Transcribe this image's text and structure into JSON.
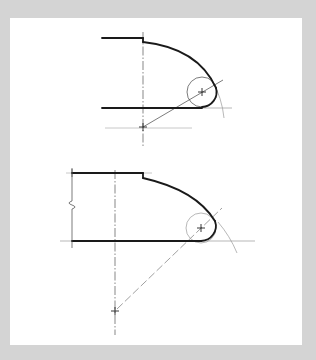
{
  "figure": {
    "title": "",
    "colors": {
      "background": "#d4d4d4",
      "panel": "#ffffff",
      "object_line": "#1a1a1a",
      "construction_line": "#9a9a9a"
    },
    "views": [
      {
        "id": "top",
        "elements": [
          "object-outline",
          "centerline",
          "large-arc",
          "fillet-circle",
          "construction-line",
          "center-mark",
          "radius-arc-trace"
        ]
      },
      {
        "id": "bottom",
        "elements": [
          "object-outline",
          "break-symbol",
          "centerline",
          "large-arc",
          "fillet-circle",
          "construction-line",
          "center-mark",
          "radius-arc-trace"
        ]
      }
    ]
  }
}
